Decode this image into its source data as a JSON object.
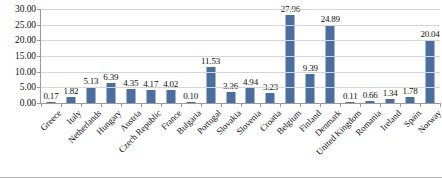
{
  "chart_data": {
    "type": "bar",
    "title": "",
    "subtitle": "",
    "xlabel": "",
    "ylabel": "",
    "ylim": [
      0,
      30
    ],
    "ytick_step": 5,
    "ytick_labels": [
      "0.00",
      "5.00",
      "10.00",
      "15.00",
      "20.00",
      "25.00",
      "30.00"
    ],
    "ytick_values": [
      0,
      5,
      10,
      15,
      20,
      25,
      30
    ],
    "grid": true,
    "legend": "none",
    "series_color": "#4a6e9e",
    "data_labels": true,
    "categories": [
      "Greece",
      "Italy",
      "Netherlands",
      "Hungary",
      "Austria",
      "Czech Republic",
      "France",
      "Bulgaria",
      "Portugal",
      "Slovakia",
      "Slovenia",
      "Croatia",
      "Belgium",
      "Finland",
      "Denmark",
      "United Kingdom",
      "Romania",
      "Ireland",
      "Spain",
      "Norway"
    ],
    "values": [
      0.17,
      1.82,
      5.13,
      6.39,
      4.35,
      4.17,
      4.02,
      0.1,
      11.53,
      3.36,
      4.94,
      3.23,
      27.96,
      9.39,
      24.89,
      0.11,
      0.66,
      1.34,
      1.78,
      20.04
    ],
    "value_labels": [
      "0.17",
      "1.82",
      "5.13",
      "6.39",
      "4.35",
      "4.17",
      "4.02",
      "0.10",
      "11.53",
      "3.36",
      "4.94",
      "3.23",
      "27.96",
      "9.39",
      "24.89",
      "0.11",
      "0.66",
      "1.34",
      "1.78",
      "20.04"
    ]
  },
  "colors": {
    "bar": "#4a6e9e",
    "grid": "#d4d4d4",
    "axis": "#9b9b9b",
    "text": "#111111",
    "background": "#ffffff"
  }
}
